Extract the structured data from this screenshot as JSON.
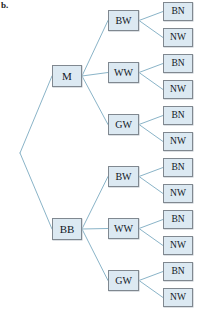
{
  "figure": {
    "part_label": "b.",
    "caption": "",
    "colors": {
      "box_fill": "#dce9f2",
      "box_border": "#808890",
      "edge_line": "#8ab4c8",
      "text": "#10171f",
      "background": "#ffffff"
    }
  },
  "tree": {
    "root": {
      "id": "root",
      "label": "",
      "x": 20,
      "y": 153,
      "visible": false
    },
    "level_1": [
      {
        "id": "m",
        "label": "M",
        "x": 52,
        "y": 65
      },
      {
        "id": "bb",
        "label": "BB",
        "x": 52,
        "y": 218
      }
    ],
    "level_2": [
      {
        "id": "m-bw",
        "parent": "m",
        "label": "BW",
        "x": 108,
        "y": 10
      },
      {
        "id": "m-ww",
        "parent": "m",
        "label": "WW",
        "x": 108,
        "y": 62
      },
      {
        "id": "m-gw",
        "parent": "m",
        "label": "GW",
        "x": 108,
        "y": 114
      },
      {
        "id": "bb-bw",
        "parent": "bb",
        "label": "BW",
        "x": 108,
        "y": 166
      },
      {
        "id": "bb-ww",
        "parent": "bb",
        "label": "WW",
        "x": 108,
        "y": 218
      },
      {
        "id": "bb-gw",
        "parent": "bb",
        "label": "GW",
        "x": 108,
        "y": 270
      }
    ],
    "level_3": [
      {
        "id": "m-bw-bn",
        "parent": "m-bw",
        "label": "BN",
        "x": 163,
        "y": 2
      },
      {
        "id": "m-bw-nw",
        "parent": "m-bw",
        "label": "NW",
        "x": 163,
        "y": 28
      },
      {
        "id": "m-ww-bn",
        "parent": "m-ww",
        "label": "BN",
        "x": 163,
        "y": 54
      },
      {
        "id": "m-ww-nw",
        "parent": "m-ww",
        "label": "NW",
        "x": 163,
        "y": 80
      },
      {
        "id": "m-gw-bn",
        "parent": "m-gw",
        "label": "BN",
        "x": 163,
        "y": 106
      },
      {
        "id": "m-gw-nw",
        "parent": "m-gw",
        "label": "NW",
        "x": 163,
        "y": 132
      },
      {
        "id": "bb-bw-bn",
        "parent": "bb-bw",
        "label": "BN",
        "x": 163,
        "y": 158
      },
      {
        "id": "bb-bw-nw",
        "parent": "bb-bw",
        "label": "NW",
        "x": 163,
        "y": 184
      },
      {
        "id": "bb-ww-bn",
        "parent": "bb-ww",
        "label": "BN",
        "x": 163,
        "y": 210
      },
      {
        "id": "bb-ww-nw",
        "parent": "bb-ww",
        "label": "NW",
        "x": 163,
        "y": 236
      },
      {
        "id": "bb-gw-bn",
        "parent": "bb-gw",
        "label": "BN",
        "x": 163,
        "y": 262
      },
      {
        "id": "bb-gw-nw",
        "parent": "bb-gw",
        "label": "NW",
        "x": 163,
        "y": 288
      }
    ]
  }
}
